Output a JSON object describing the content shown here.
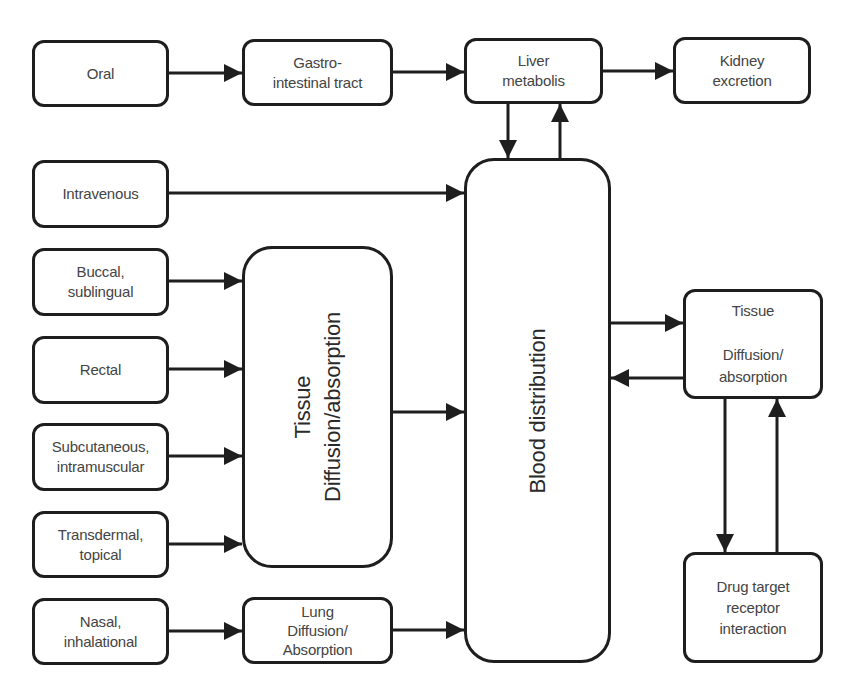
{
  "diagram": {
    "type": "flowchart",
    "nodes": {
      "oral": {
        "label": "Oral"
      },
      "gi_tract": {
        "label": "Gastro-\nintestinal tract"
      },
      "liver": {
        "label": "Liver\nmetabolis"
      },
      "kidney": {
        "label": "Kidney\nexcretion"
      },
      "intravenous": {
        "label": "Intravenous"
      },
      "buccal": {
        "label": "Buccal,\nsublingual"
      },
      "rectal": {
        "label": "Rectal"
      },
      "subcutaneous": {
        "label": "Subcutaneous,\nintramuscular"
      },
      "transdermal": {
        "label": "Transdermal,\ntopical"
      },
      "nasal": {
        "label": "Nasal,\ninhalational"
      },
      "tissue_absorption": {
        "label": "Tissue\nDiffusion/absorption"
      },
      "lung": {
        "label": "Lung\nDiffusion/\nAbsorption"
      },
      "blood": {
        "label": "Blood distribution"
      },
      "tissue_right": {
        "label": "Tissue\n\nDiffusion/\nabsorption"
      },
      "drug_target": {
        "label": "Drug target\nreceptor\ninteraction"
      }
    },
    "edges": [
      {
        "from": "oral",
        "to": "gi_tract"
      },
      {
        "from": "gi_tract",
        "to": "liver"
      },
      {
        "from": "liver",
        "to": "kidney"
      },
      {
        "from": "liver",
        "to": "blood"
      },
      {
        "from": "blood",
        "to": "liver"
      },
      {
        "from": "intravenous",
        "to": "blood"
      },
      {
        "from": "buccal",
        "to": "tissue_absorption"
      },
      {
        "from": "rectal",
        "to": "tissue_absorption"
      },
      {
        "from": "subcutaneous",
        "to": "tissue_absorption"
      },
      {
        "from": "transdermal",
        "to": "tissue_absorption"
      },
      {
        "from": "tissue_absorption",
        "to": "blood"
      },
      {
        "from": "nasal",
        "to": "lung"
      },
      {
        "from": "lung",
        "to": "blood"
      },
      {
        "from": "blood",
        "to": "tissue_right"
      },
      {
        "from": "tissue_right",
        "to": "blood"
      },
      {
        "from": "tissue_right",
        "to": "drug_target"
      },
      {
        "from": "drug_target",
        "to": "tissue_right"
      }
    ],
    "colors": {
      "stroke": "#1e1e1e",
      "text": "#444444",
      "background": "#ffffff"
    }
  }
}
